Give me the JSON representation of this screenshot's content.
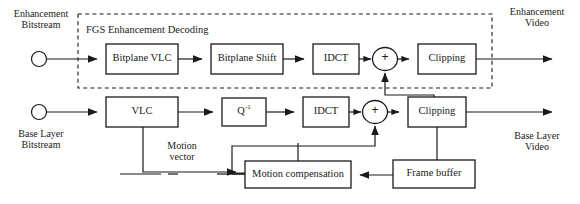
{
  "diagram": {
    "group_label": "FGS Enhancement Decoding",
    "colors": {
      "stroke": "#1a1a1a",
      "fill": "#ffffff",
      "text": "#1a1a1a"
    }
  },
  "terminals": [
    {
      "id": "enh-in",
      "label": "Enhancement\nBitstream"
    },
    {
      "id": "base-in",
      "label": "Base Layer\nBitstream"
    }
  ],
  "outputs": [
    {
      "id": "enh-out",
      "label": "Enhancement\nVideo"
    },
    {
      "id": "base-out",
      "label": "Base Layer\nVideo"
    }
  ],
  "blocks": [
    {
      "id": "bitplane-vlc",
      "label": "Bitplane VLC"
    },
    {
      "id": "bitplane-shift",
      "label": "Bitplane Shift"
    },
    {
      "id": "idct-enh",
      "label": "IDCT"
    },
    {
      "id": "clipping-enh",
      "label": "Clipping"
    },
    {
      "id": "vlc",
      "label": "VLC"
    },
    {
      "id": "iq",
      "label": "Q",
      "superscript": "-1"
    },
    {
      "id": "idct-base",
      "label": "IDCT"
    },
    {
      "id": "clipping-base",
      "label": "Clipping"
    },
    {
      "id": "motion-compensation",
      "label": "Motion compensation"
    },
    {
      "id": "frame-buffer",
      "label": "Frame buffer"
    }
  ],
  "adders": [
    {
      "id": "adder-enh",
      "symbol": "+"
    },
    {
      "id": "adder-base",
      "symbol": "+"
    }
  ],
  "annotations": [
    {
      "id": "motion-vector",
      "label": "Motion\nvector"
    }
  ]
}
